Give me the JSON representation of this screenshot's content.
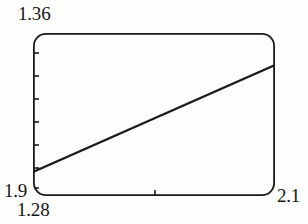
{
  "chart_data": {
    "type": "line",
    "title": "",
    "xlabel": "",
    "ylabel": "",
    "xlim": [
      1.9,
      2.1
    ],
    "ylim": [
      1.28,
      1.36
    ],
    "grid": false,
    "legend": null,
    "axis_labels": {
      "y_max": "1.36",
      "y_min": "1.28",
      "x_min": "1.9",
      "x_max": "2.1"
    },
    "tick_labels": {
      "x": [
        "1.9",
        "2.1"
      ],
      "y": [
        "1.28",
        "1.36"
      ]
    },
    "y_axis_tick_count": 7,
    "x_axis_tick_count": 1,
    "series": [
      {
        "name": "line",
        "color": "#1a1a1a",
        "x": [
          1.9,
          2.1
        ],
        "y": [
          1.2982,
          1.3425
        ]
      }
    ],
    "annotations": []
  },
  "style": {
    "frame_color": "#1a1a1a",
    "line_color": "#1a1a1a",
    "background": "#fdfdfb",
    "frame_corner_radius_px": 12,
    "frame_stroke_px": 1.8,
    "line_stroke_px": 2.2
  },
  "geometry": {
    "frame": {
      "x": 33,
      "y": 33,
      "width": 242,
      "height": 163
    },
    "line_pixels": {
      "x1": 0,
      "y1": 139,
      "x2": 242,
      "y2": 32
    },
    "y_ticks_px": [
      20,
      43,
      66,
      89,
      112,
      135,
      155
    ],
    "x_ticks_px": [
      122
    ],
    "tick_length_px": 5
  }
}
